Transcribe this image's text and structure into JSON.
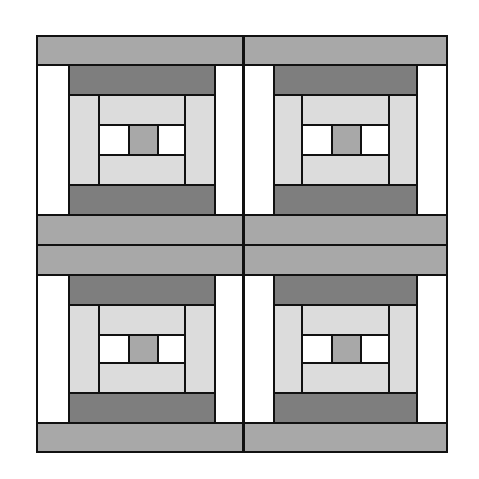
{
  "diagram": {
    "type": "log-cabin quilt layout",
    "grid": {
      "rows": 2,
      "cols": 2
    },
    "colors": {
      "white": "#ffffff",
      "light": "#dcdcdc",
      "mid": "#a8a8a8",
      "dark": "#7e7e7e",
      "outline": "#111111"
    },
    "blocks": [
      {
        "position": "top-left"
      },
      {
        "position": "top-right"
      },
      {
        "position": "bottom-left"
      },
      {
        "position": "bottom-right"
      }
    ]
  }
}
